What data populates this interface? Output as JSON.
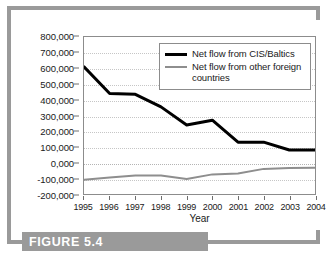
{
  "figure": {
    "caption": "FIGURE 5.4"
  },
  "chart_data": {
    "type": "line",
    "title": "",
    "subtitle": "",
    "xlabel": "Year",
    "ylabel": "",
    "grid": true,
    "legend_position": "top-right",
    "categories": [
      "1995",
      "1996",
      "1997",
      "1998",
      "1999",
      "2000",
      "2001",
      "2002",
      "2003",
      "2004"
    ],
    "x": [
      1995,
      1996,
      1997,
      1998,
      1999,
      2000,
      2001,
      2002,
      2003,
      2004
    ],
    "xlim": [
      1995,
      2004
    ],
    "ylim": [
      -200000,
      800000
    ],
    "ytick_labels": [
      "800,000",
      "700,000",
      "600,000",
      "500,000",
      "400,000",
      "300,000",
      "200,000",
      "100,000",
      "0,000",
      "-100,000",
      "-200,000"
    ],
    "ytick_values": [
      800000,
      700000,
      600000,
      500000,
      400000,
      300000,
      200000,
      100000,
      0,
      -100000,
      -200000
    ],
    "series": [
      {
        "name": "Net flow from CIS/Baltics",
        "color": "#000000",
        "width": 3,
        "values": [
          610000,
          440000,
          435000,
          355000,
          240000,
          270000,
          130000,
          130000,
          80000,
          80000
        ]
      },
      {
        "name": "Net flow from other foreign countries",
        "color": "#8e8e8e",
        "width": 2,
        "values": [
          -110000,
          -95000,
          -82000,
          -82000,
          -105000,
          -75000,
          -70000,
          -40000,
          -35000,
          -32000
        ]
      }
    ]
  },
  "legend": {
    "entries": [
      {
        "label": "Net flow from CIS/Baltics"
      },
      {
        "label": "Net flow from other foreign countries"
      }
    ]
  },
  "colors": {
    "frame": "#9a9a9a",
    "caption_band": "#9a9a9a",
    "primary_series": "#000000",
    "secondary_series": "#8e8e8e",
    "gridline": "#c6c6c6",
    "axis": "#8c8c8c",
    "background": "#ffffff"
  }
}
